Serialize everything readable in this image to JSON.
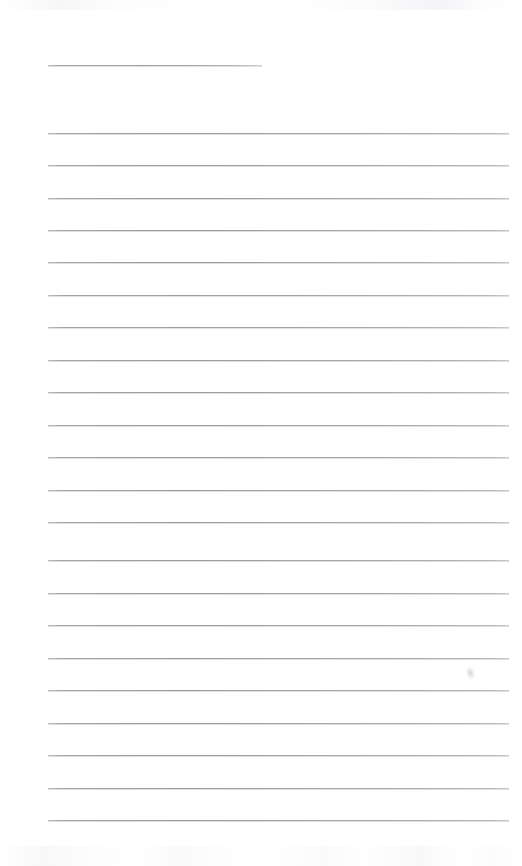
{
  "document": {
    "type": "scanned-lined-notebook-page",
    "title": "Blank ruled notebook page",
    "page_width": 522,
    "page_height": 866,
    "background_color": "#ffffff",
    "rule_color": "#9a9a9f",
    "text_content": "",
    "has_handwriting": false
  },
  "layout": {
    "left_margin": 48,
    "right_margin": 510,
    "header_rule_right": 262,
    "line_spacing": 32.5
  },
  "rules": [
    {
      "id": "header-rule",
      "label": "header rule",
      "y": 65,
      "x1": 48,
      "x2": 262,
      "variant": "header"
    },
    {
      "id": "rule-01",
      "label": "ruled line 1",
      "y": 133,
      "x1": 48,
      "x2": 509,
      "variant": "full"
    },
    {
      "id": "rule-02",
      "label": "ruled line 2",
      "y": 165,
      "x1": 48,
      "x2": 509,
      "variant": "full"
    },
    {
      "id": "rule-03",
      "label": "ruled line 3",
      "y": 198,
      "x1": 48,
      "x2": 509,
      "variant": "full"
    },
    {
      "id": "rule-04",
      "label": "ruled line 4",
      "y": 230,
      "x1": 48,
      "x2": 509,
      "variant": "full"
    },
    {
      "id": "rule-05",
      "label": "ruled line 5",
      "y": 262,
      "x1": 48,
      "x2": 509,
      "variant": "full"
    },
    {
      "id": "rule-06",
      "label": "ruled line 6",
      "y": 295,
      "x1": 48,
      "x2": 509,
      "variant": "full"
    },
    {
      "id": "rule-07",
      "label": "ruled line 7",
      "y": 327,
      "x1": 48,
      "x2": 509,
      "variant": "full"
    },
    {
      "id": "rule-08",
      "label": "ruled line 8",
      "y": 360,
      "x1": 48,
      "x2": 509,
      "variant": "full"
    },
    {
      "id": "rule-09",
      "label": "ruled line 9",
      "y": 392,
      "x1": 48,
      "x2": 509,
      "variant": "full"
    },
    {
      "id": "rule-10",
      "label": "ruled line 10",
      "y": 425,
      "x1": 48,
      "x2": 509,
      "variant": "full"
    },
    {
      "id": "rule-11",
      "label": "ruled line 11",
      "y": 457,
      "x1": 48,
      "x2": 509,
      "variant": "full"
    },
    {
      "id": "rule-12",
      "label": "ruled line 12",
      "y": 490,
      "x1": 48,
      "x2": 509,
      "variant": "full"
    },
    {
      "id": "rule-13",
      "label": "ruled line 13",
      "y": 522,
      "x1": 48,
      "x2": 509,
      "variant": "full"
    },
    {
      "id": "rule-14",
      "label": "ruled line 14",
      "y": 560,
      "x1": 48,
      "x2": 509,
      "variant": "full"
    },
    {
      "id": "rule-15",
      "label": "ruled line 15",
      "y": 593,
      "x1": 48,
      "x2": 509,
      "variant": "full"
    },
    {
      "id": "rule-16",
      "label": "ruled line 16",
      "y": 625,
      "x1": 48,
      "x2": 509,
      "variant": "full"
    },
    {
      "id": "rule-17",
      "label": "ruled line 17",
      "y": 658,
      "x1": 48,
      "x2": 509,
      "variant": "full"
    },
    {
      "id": "rule-18",
      "label": "ruled line 18",
      "y": 690,
      "x1": 48,
      "x2": 509,
      "variant": "full"
    },
    {
      "id": "rule-19",
      "label": "ruled line 19",
      "y": 723,
      "x1": 48,
      "x2": 509,
      "variant": "full"
    },
    {
      "id": "rule-20",
      "label": "ruled line 20",
      "y": 755,
      "x1": 48,
      "x2": 509,
      "variant": "full"
    },
    {
      "id": "rule-21",
      "label": "ruled line 21",
      "y": 788,
      "x1": 48,
      "x2": 509,
      "variant": "full"
    },
    {
      "id": "rule-22",
      "label": "ruled line 22",
      "y": 820,
      "x1": 48,
      "x2": 509,
      "variant": "full"
    }
  ],
  "marks": [
    {
      "id": "smudge-right",
      "label": "faint pencil smudge",
      "x": 466,
      "y": 666,
      "width": 9,
      "height": 14
    }
  ],
  "artifacts": {
    "top_band_label": "scanner edge artifact (top)",
    "bottom_band_label": "scanner edge artifact (bottom)"
  }
}
